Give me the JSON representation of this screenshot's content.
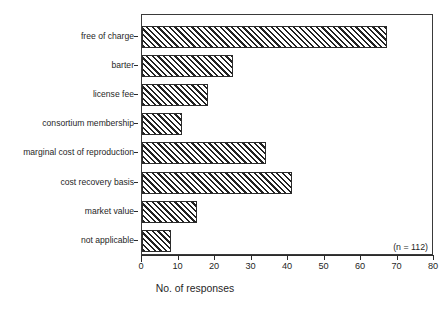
{
  "chart_data": {
    "type": "bar",
    "orientation": "horizontal",
    "title": "",
    "xlabel": "No. of responses",
    "ylabel": "",
    "xlim": [
      0,
      80
    ],
    "xticks": [
      0,
      10,
      20,
      30,
      40,
      50,
      60,
      70,
      80
    ],
    "xtick_labels": [
      "0",
      "10",
      "20",
      "30",
      "40",
      "50",
      "60",
      "70",
      "80"
    ],
    "grid": false,
    "legend": false,
    "annotation": "(n = 112)",
    "categories": [
      "free of charge",
      "barter",
      "license fee",
      "consortium membership",
      "marginal cost of reproduction",
      "cost recovery basis",
      "market value",
      "not applicable"
    ],
    "values": [
      67,
      25,
      18,
      11,
      34,
      41,
      15,
      8
    ],
    "bar_fill": "hatched-diagonal",
    "bar_edge_color": "#2b2b2b"
  },
  "colors": {
    "ink": "#1f1f1f",
    "axis": "#2b2b2b",
    "hatch": "#222222",
    "background": "#ffffff"
  }
}
